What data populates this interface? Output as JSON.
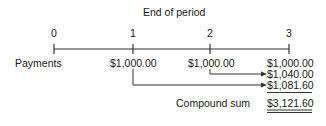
{
  "title": "End of period",
  "timeline": {
    "ticks": [
      "0",
      "1",
      "2",
      "3"
    ]
  },
  "row_label": "Payments",
  "payments": {
    "period_1": "$1,000.00",
    "period_2": "$1,000.00",
    "period_3": "$1,000.00"
  },
  "future_values": {
    "from_period_2": "$1,040.00",
    "from_period_1": "$1,081.60"
  },
  "total": {
    "label": "Compound sum",
    "value": "$3,121.60"
  },
  "colors": {
    "ink": "#1a1a1a",
    "background": "#ffffff"
  }
}
